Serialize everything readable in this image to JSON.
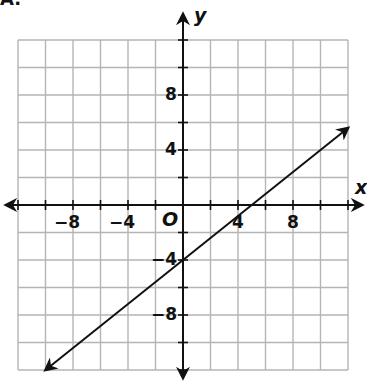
{
  "figure_label": "A.",
  "chart_data": {
    "type": "line",
    "title": "",
    "xlabel": "x",
    "ylabel": "y",
    "origin_label": "O",
    "xlim": [
      -12,
      12
    ],
    "ylim": [
      -12,
      12
    ],
    "grid": true,
    "grid_step": 2,
    "x_tick_labels": [
      {
        "value": -8,
        "text": "−8"
      },
      {
        "value": -4,
        "text": "−4"
      },
      {
        "value": 4,
        "text": "4"
      },
      {
        "value": 8,
        "text": "8"
      }
    ],
    "y_tick_labels": [
      {
        "value": 8,
        "text": "8"
      },
      {
        "value": 4,
        "text": "4"
      },
      {
        "value": -4,
        "text": "−4"
      },
      {
        "value": -8,
        "text": "−8"
      }
    ],
    "series": [
      {
        "name": "line",
        "equation": "y = 0.8x - 4",
        "slope": 0.8,
        "intercept": -4,
        "x": [
          -10,
          -5,
          0,
          5,
          12
        ],
        "values": [
          -12,
          -8,
          -4,
          0,
          5.6
        ],
        "arrows": "both"
      }
    ],
    "colors": {
      "grid": "#b5b5b5",
      "axis": "#111111",
      "line": "#111111"
    }
  }
}
